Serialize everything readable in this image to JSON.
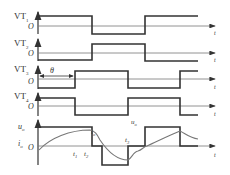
{
  "diagram": {
    "type": "waveform-timing-diagram",
    "colors": {
      "line": "#333333",
      "axis": "#666666",
      "curve": "#777777"
    },
    "channels": [
      {
        "name": "VT",
        "sub": "1",
        "origin": "O",
        "axis_label": "t"
      },
      {
        "name": "VT",
        "sub": "2",
        "origin": "O",
        "axis_label": "t"
      },
      {
        "name": "VT",
        "sub": "3",
        "origin": "O",
        "axis_label": "t",
        "annotation": "θ"
      },
      {
        "name": "VT",
        "sub": "4",
        "origin": "O",
        "axis_label": "t"
      }
    ],
    "output": {
      "voltage_label": "u",
      "voltage_sub": "o",
      "current_label": "i",
      "current_sub": "o",
      "origin": "O",
      "axis_label": "t",
      "curve_label_i": "i",
      "curve_label_i_sub": "o",
      "curve_label_u": "u",
      "curve_label_u_sub": "o",
      "times": [
        {
          "label": "t",
          "sub": "1"
        },
        {
          "label": "t",
          "sub": "2"
        },
        {
          "label": "t",
          "sub": "3"
        }
      ]
    }
  }
}
